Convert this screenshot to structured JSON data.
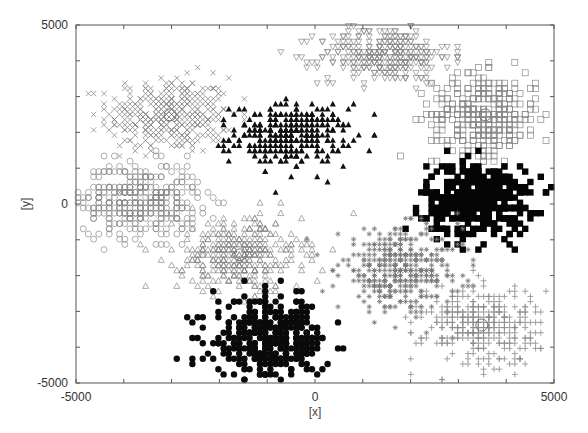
{
  "chart_data": {
    "type": "scatter",
    "title": "",
    "xlabel": "[x]",
    "ylabel": "[y]",
    "xlim": [
      -5000,
      5000
    ],
    "ylim": [
      -5000,
      5000
    ],
    "x_tick_labels": [
      {
        "value": -5000,
        "label": "-5000"
      },
      {
        "value": 0,
        "label": "0"
      },
      {
        "value": 5000,
        "label": "5000"
      }
    ],
    "y_tick_labels": [
      {
        "value": 5000,
        "label": "5000"
      },
      {
        "value": 0,
        "label": "0"
      },
      {
        "value": -5000,
        "label": "-5000"
      }
    ],
    "minor_tick_step": 1000,
    "grid": false,
    "legend": "none",
    "series": [
      {
        "name": "cluster-x",
        "marker": "x",
        "color": "#8a8a8a",
        "center": [
          -3030,
          2490
        ],
        "spread": [
          650,
          520
        ],
        "count": 380,
        "centroid_marker": true
      },
      {
        "name": "cluster-triangle-filled",
        "marker": "triangle-filled",
        "color": "#111111",
        "center": [
          -520,
          1930
        ],
        "spread": [
          600,
          420
        ],
        "count": 330,
        "centroid_marker": false
      },
      {
        "name": "cluster-triangle-down",
        "marker": "triangle-down",
        "color": "#8a8a8a",
        "center": [
          1460,
          4160
        ],
        "spread": [
          680,
          380
        ],
        "count": 330,
        "centroid_marker": false
      },
      {
        "name": "cluster-square-open",
        "marker": "square-open",
        "color": "#8a8a8a",
        "center": [
          3560,
          2490
        ],
        "spread": [
          560,
          560
        ],
        "count": 360,
        "centroid_marker": true
      },
      {
        "name": "cluster-circle-open",
        "marker": "circle-open",
        "color": "#8a8a8a",
        "center": [
          -3660,
          110
        ],
        "spread": [
          620,
          520
        ],
        "count": 380,
        "centroid_marker": false
      },
      {
        "name": "cluster-square-filled",
        "marker": "square-filled",
        "color": "#050505",
        "center": [
          3410,
          110
        ],
        "spread": [
          560,
          500
        ],
        "count": 420,
        "centroid_marker": false
      },
      {
        "name": "cluster-triangle-open",
        "marker": "triangle-open",
        "color": "#8a8a8a",
        "center": [
          -1570,
          -1420
        ],
        "spread": [
          650,
          520
        ],
        "count": 360,
        "centroid_marker": true
      },
      {
        "name": "cluster-asterisk",
        "marker": "asterisk",
        "color": "#7a7a7a",
        "center": [
          1780,
          -1840
        ],
        "spread": [
          640,
          560
        ],
        "count": 380,
        "centroid_marker": false
      },
      {
        "name": "cluster-circle-filled",
        "marker": "circle-filled",
        "color": "#0a0a0a",
        "center": [
          -940,
          -3800
        ],
        "spread": [
          600,
          560
        ],
        "count": 360,
        "centroid_marker": false
      },
      {
        "name": "cluster-plus",
        "marker": "plus",
        "color": "#8a8a8a",
        "center": [
          3490,
          -3380
        ],
        "spread": [
          620,
          560
        ],
        "count": 340,
        "centroid_marker": true
      }
    ]
  },
  "plot_area": {
    "left": 76,
    "top": 25,
    "right": 554,
    "bottom": 383
  }
}
